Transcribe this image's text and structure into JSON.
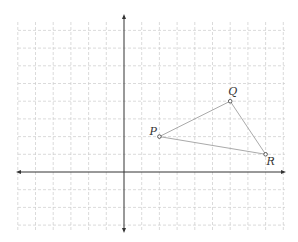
{
  "diagram": {
    "type": "coordinate-plane",
    "grid": {
      "spacing_px": 17.7,
      "origin_px": [
        124,
        172
      ],
      "x_range": [
        -6,
        9
      ],
      "y_range": [
        -3,
        8
      ],
      "line_color": "#cccccc",
      "style": "dashed"
    },
    "axes": {
      "color": "#333333",
      "x_arrows": true,
      "y_arrows": true
    },
    "triangle": {
      "stroke_color": "#aaaaaa",
      "points": [
        {
          "label": "P",
          "x": 2,
          "y": 2
        },
        {
          "label": "Q",
          "x": 6,
          "y": 4
        },
        {
          "label": "R",
          "x": 8,
          "y": 1
        }
      ]
    }
  }
}
